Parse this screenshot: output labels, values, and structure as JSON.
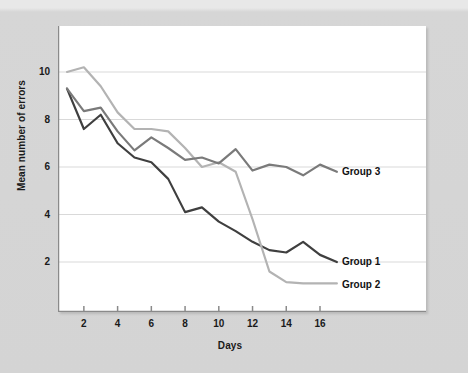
{
  "chart_data": {
    "type": "line",
    "title": "",
    "xlabel": "Days",
    "ylabel": "Mean number of errors",
    "xlim": [
      1,
      17
    ],
    "ylim": [
      0,
      11.5
    ],
    "xticks": [
      2,
      4,
      6,
      8,
      10,
      12,
      14,
      16
    ],
    "yticks": [
      2,
      4,
      6,
      8,
      10
    ],
    "grid": "horizontal",
    "legend_position": "right-inline-labels",
    "x": [
      1,
      2,
      3,
      4,
      5,
      6,
      7,
      8,
      9,
      10,
      11,
      12,
      13,
      14,
      15,
      16,
      17
    ],
    "series": [
      {
        "name": "Group 1",
        "color": "#3f3f3f",
        "values": [
          9.3,
          7.6,
          8.2,
          7.0,
          6.4,
          6.2,
          5.5,
          4.1,
          4.3,
          3.7,
          3.3,
          2.85,
          2.5,
          2.4,
          2.85,
          2.3,
          2.0
        ],
        "label_x": 17.2,
        "label_y": 2.0
      },
      {
        "name": "Group 2",
        "color": "#b3b3b3",
        "values": [
          10.0,
          10.2,
          9.4,
          8.3,
          7.6,
          7.6,
          7.5,
          6.8,
          6.0,
          6.2,
          5.8,
          3.8,
          1.6,
          1.15,
          1.1,
          1.1,
          1.1
        ],
        "label_x": 17.2,
        "label_y": 1.1
      },
      {
        "name": "Group 3",
        "color": "#7a7a7a",
        "values": [
          9.3,
          8.35,
          8.5,
          7.5,
          6.7,
          7.25,
          6.8,
          6.3,
          6.4,
          6.15,
          6.75,
          5.85,
          6.1,
          6.0,
          5.65,
          6.1,
          5.8
        ],
        "label_x": 17.2,
        "label_y": 5.8
      }
    ],
    "annotations": [
      {
        "text": "Group 3",
        "x": 17.3,
        "y": 5.8
      },
      {
        "text": "Group 1",
        "x": 17.3,
        "y": 2.0
      },
      {
        "text": "Group 2",
        "x": 17.3,
        "y": 1.05
      }
    ]
  },
  "axes": {
    "y_tick_labels": [
      "2",
      "4",
      "6",
      "8",
      "10"
    ],
    "x_tick_labels": [
      "2",
      "4",
      "6",
      "8",
      "10",
      "12",
      "14",
      "16"
    ],
    "x_title": "Days",
    "y_title": "Mean number of errors"
  },
  "colors": {
    "background": "#d6d6d6",
    "plot_background": "#ffffff",
    "grid": "#d9d9d9",
    "axis": "#8a8a8a",
    "text": "#111111"
  }
}
